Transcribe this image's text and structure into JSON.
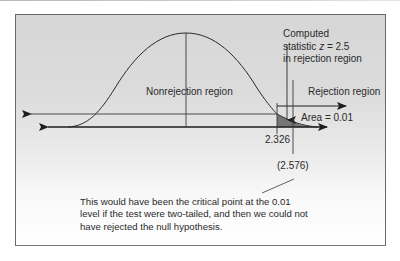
{
  "figure": {
    "labels": {
      "nonrejection": "Nonrejection region",
      "rejection": "Rejection region",
      "area": "Area = 0.01",
      "computed_line1": "Computed",
      "computed_line2_prefix": "statistic ",
      "computed_line2_var": "z",
      "computed_line2_suffix": " = 2.5",
      "computed_line3": "in rejection region",
      "critical_one_tailed": "2.326",
      "critical_two_tailed": "(2.576)"
    },
    "caption": {
      "line1": "This would have been the critical point at the 0.01",
      "line2": "level if the test were two-tailed, and then we could not",
      "line3": "have rejected the null hypothesis."
    },
    "colors": {
      "line": "#3a3a3a",
      "shade": "#767676",
      "text": "#2a2a2a"
    },
    "values": {
      "alpha": 0.01,
      "z_computed": 2.5,
      "z_critical_one_tailed": 2.326,
      "z_critical_two_tailed": 2.576
    }
  }
}
